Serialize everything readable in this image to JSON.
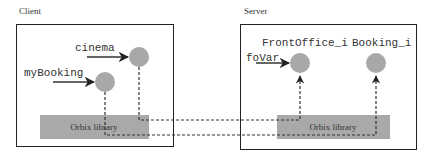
{
  "client": {
    "title": "Client",
    "objects": [
      {
        "ref": "cinema"
      },
      {
        "ref": "myBooking"
      }
    ],
    "library": "Orbix library"
  },
  "server": {
    "title": "Server",
    "objects": [
      {
        "name": "FrontOffice_i",
        "ref": "foVar"
      },
      {
        "name": "Booking_i"
      }
    ],
    "library": "Orbix library"
  },
  "colors": {
    "box_border": "#222222",
    "object_fill": "#a8a8a8",
    "library_fill": "#a9a9a9",
    "line": "#333333"
  }
}
